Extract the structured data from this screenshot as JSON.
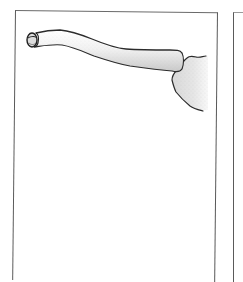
{
  "figure": {
    "parts": [
      {
        "id": "clavicle",
        "label": "Clavicle"
      },
      {
        "id": "sternal-end",
        "label": "Sternal end"
      },
      {
        "id": "acromial-end",
        "label": "Acromial end"
      },
      {
        "id": "acromion",
        "label": "Acromion (scapula)"
      }
    ]
  },
  "colors": {
    "outline": "#2b2b2b",
    "bone_fill": "#ececec",
    "bone_shade": "#c8c8c8",
    "frame": "#5a5a5a",
    "background": "#ffffff"
  }
}
